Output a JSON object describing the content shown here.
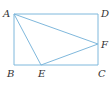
{
  "diagram": {
    "type": "geometry",
    "line_color": "#7fb8dc",
    "label_color": "#333333",
    "points": {
      "A": {
        "x": 14,
        "y": 14,
        "label": "A",
        "lx": 3,
        "ly": 17
      },
      "B": {
        "x": 14,
        "y": 65,
        "label": "B",
        "lx": 7,
        "ly": 77
      },
      "C": {
        "x": 98,
        "y": 65,
        "label": "C",
        "lx": 98,
        "ly": 77
      },
      "D": {
        "x": 98,
        "y": 14,
        "label": "D",
        "lx": 101,
        "ly": 17
      },
      "E": {
        "x": 41,
        "y": 65,
        "label": "E",
        "lx": 38,
        "ly": 77
      },
      "F": {
        "x": 98,
        "y": 44,
        "label": "F",
        "lx": 101,
        "ly": 48
      }
    },
    "segments": [
      {
        "from": "A",
        "to": "D"
      },
      {
        "from": "D",
        "to": "C"
      },
      {
        "from": "C",
        "to": "B"
      },
      {
        "from": "B",
        "to": "A"
      },
      {
        "from": "A",
        "to": "E"
      },
      {
        "from": "A",
        "to": "F"
      },
      {
        "from": "E",
        "to": "F"
      }
    ]
  }
}
